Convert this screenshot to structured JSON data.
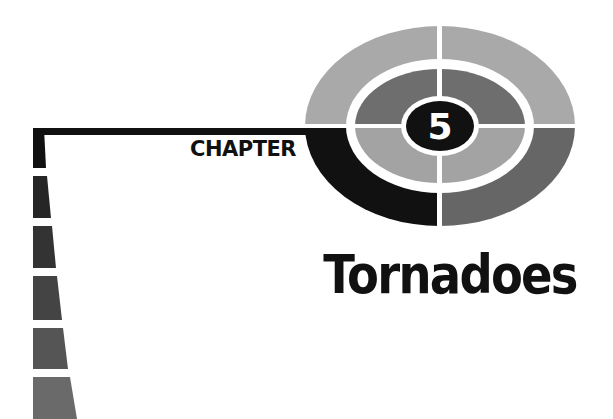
{
  "chapter": {
    "label": "CHAPTER",
    "number": "5",
    "title": "Tornadoes"
  },
  "colors": {
    "black": "#111111",
    "outer_light": "#a9a9a9",
    "outer_dark": "#666666",
    "inner_dark": "#6e6e6e",
    "inner_light": "#a3a3a3",
    "divider": "#ffffff"
  },
  "side_bars": [
    {
      "shade": "#111111"
    },
    {
      "shade": "#262626"
    },
    {
      "shade": "#333333"
    },
    {
      "shade": "#444444"
    },
    {
      "shade": "#555555"
    },
    {
      "shade": "#6a6a6a"
    }
  ]
}
